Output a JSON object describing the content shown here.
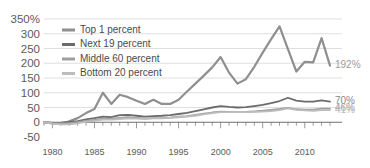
{
  "chart_data": {
    "type": "line",
    "title": "",
    "subtitle": "",
    "xlabel": "",
    "ylabel": "",
    "xlim": [
      1979,
      2013
    ],
    "ylim": [
      -50,
      350
    ],
    "grid": true,
    "legend_position": "inside-top-left",
    "y_ticks": [
      "350%",
      "300",
      "250",
      "200",
      "150",
      "100",
      "50",
      "0",
      "-50"
    ],
    "y_tick_values": [
      350,
      300,
      250,
      200,
      150,
      100,
      50,
      0,
      -50
    ],
    "x_ticks": [
      "1980",
      "1985",
      "1990",
      "1995",
      "2000",
      "2005",
      "2010"
    ],
    "x_tick_values": [
      1980,
      1985,
      1990,
      1995,
      2000,
      2005,
      2010
    ],
    "x": [
      1979,
      1980,
      1981,
      1982,
      1983,
      1984,
      1985,
      1986,
      1987,
      1988,
      1989,
      1990,
      1991,
      1992,
      1993,
      1994,
      1995,
      1996,
      1997,
      1998,
      1999,
      2000,
      2001,
      2002,
      2003,
      2004,
      2005,
      2006,
      2007,
      2008,
      2009,
      2010,
      2011,
      2012,
      2013
    ],
    "series": [
      {
        "name": "Top 1 percent",
        "color": "#8f8f8f",
        "width": 2.2,
        "end_label": "192%",
        "end_value": 192,
        "values": [
          0,
          -4,
          -6,
          3,
          14,
          31,
          45,
          100,
          62,
          93,
          85,
          73,
          62,
          76,
          62,
          62,
          76,
          104,
          131,
          158,
          186,
          221,
          168,
          131,
          146,
          188,
          236,
          282,
          325,
          248,
          172,
          205,
          203,
          285,
          192
        ]
      },
      {
        "name": "Next 19 percent",
        "color": "#6b6b6b",
        "width": 1.8,
        "end_label": "70%",
        "end_value": 70,
        "values": [
          0,
          -2,
          -1,
          1,
          4,
          10,
          14,
          19,
          17,
          24,
          25,
          22,
          19,
          21,
          22,
          24,
          28,
          32,
          38,
          44,
          50,
          55,
          52,
          50,
          51,
          55,
          59,
          65,
          72,
          83,
          73,
          70,
          70,
          74,
          70
        ]
      },
      {
        "name": "Middle 60 percent",
        "color": "#9e9e9e",
        "width": 1.8,
        "end_label": "46%",
        "end_value": 46,
        "values": [
          0,
          -3,
          -4,
          -3,
          0,
          5,
          8,
          12,
          12,
          15,
          17,
          15,
          13,
          14,
          14,
          16,
          19,
          21,
          25,
          29,
          33,
          36,
          35,
          34,
          35,
          37,
          39,
          42,
          45,
          49,
          44,
          43,
          43,
          46,
          46
        ]
      },
      {
        "name": "Bottom 20 percent",
        "color": "#bdbdbd",
        "width": 1.8,
        "end_label": "41%",
        "end_value": 41,
        "values": [
          0,
          -5,
          -7,
          -7,
          -4,
          2,
          5,
          9,
          9,
          11,
          13,
          12,
          11,
          13,
          13,
          15,
          17,
          19,
          22,
          27,
          31,
          34,
          34,
          34,
          34,
          35,
          36,
          38,
          41,
          47,
          42,
          40,
          39,
          41,
          41
        ]
      }
    ],
    "end_labels": [
      {
        "text": "192%",
        "value": 192,
        "color": "#9a9a9a"
      },
      {
        "text": "70%",
        "value": 70,
        "color": "#8a8a8a"
      },
      {
        "text": "46%",
        "value": 46,
        "color": "#a5a5a5"
      },
      {
        "text": "41%",
        "value": 41,
        "color": "#bdbdbd"
      }
    ]
  }
}
